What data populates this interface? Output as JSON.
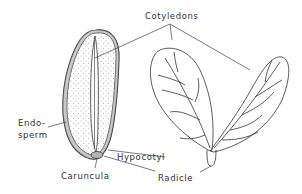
{
  "diagram": {
    "labels": {
      "cotyledons": "Cotyledons",
      "endosperm_line1": "Endo-",
      "endosperm_line2": "sperm",
      "hypocotyl": "Hypocotyl",
      "caruncula": "Caruncula",
      "radicle": "Radicle"
    },
    "colors": {
      "stroke": "#333333",
      "stipple": "#6a6a6a",
      "background": "#ffffff"
    }
  }
}
